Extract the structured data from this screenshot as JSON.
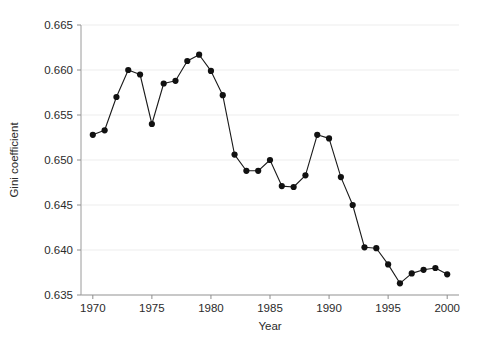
{
  "chart_data": {
    "type": "line",
    "title": "",
    "subtitle": "",
    "xlabel": "Year",
    "ylabel": "Gini coefficient",
    "xlim": [
      1969,
      2001
    ],
    "ylim": [
      0.635,
      0.665
    ],
    "xticks": [
      1970,
      1975,
      1980,
      1985,
      1990,
      1995,
      2000
    ],
    "xtick_labels": [
      "1970",
      "1975",
      "1980",
      "1985",
      "1990",
      "1995",
      "2000"
    ],
    "yticks": [
      0.635,
      0.64,
      0.645,
      0.65,
      0.655,
      0.66,
      0.665
    ],
    "ytick_labels": [
      "0.635",
      "0.640",
      "0.645",
      "0.650",
      "0.655",
      "0.660",
      "0.665"
    ],
    "grid": "horizontal",
    "grid_color": "#ededed",
    "legend": null,
    "legend_position": "none",
    "marker": "filled-circle",
    "marker_color": "#111111",
    "line_color": "#1a1a1a",
    "annotations": [],
    "x": [
      1970,
      1971,
      1972,
      1973,
      1974,
      1975,
      1976,
      1977,
      1978,
      1979,
      1980,
      1981,
      1982,
      1983,
      1984,
      1985,
      1986,
      1987,
      1988,
      1989,
      1990,
      1991,
      1992,
      1993,
      1994,
      1995,
      1996,
      1997,
      1998,
      1999,
      2000
    ],
    "y": [
      0.6528,
      0.6533,
      0.657,
      0.66,
      0.6595,
      0.654,
      0.6585,
      0.6588,
      0.661,
      0.6617,
      0.6599,
      0.6572,
      0.6506,
      0.6488,
      0.6488,
      0.65,
      0.6471,
      0.647,
      0.6483,
      0.6528,
      0.6524,
      0.6481,
      0.645,
      0.6403,
      0.6402,
      0.6384,
      0.6363,
      0.6374,
      0.6378,
      0.638,
      0.6373
    ],
    "series": [
      {
        "name": "Gini coefficient",
        "values": [
          0.6528,
          0.6533,
          0.657,
          0.66,
          0.6595,
          0.654,
          0.6585,
          0.6588,
          0.661,
          0.6617,
          0.6599,
          0.6572,
          0.6506,
          0.6488,
          0.6488,
          0.65,
          0.6471,
          0.647,
          0.6483,
          0.6528,
          0.6524,
          0.6481,
          0.645,
          0.6403,
          0.6402,
          0.6384,
          0.6363,
          0.6374,
          0.6378,
          0.638,
          0.6373
        ]
      }
    ]
  },
  "axes": {
    "x_title": "Year",
    "y_title": "Gini coefficient"
  }
}
